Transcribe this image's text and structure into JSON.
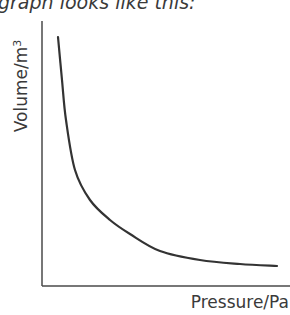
{
  "caption": "graph looks like this:",
  "chart_data": {
    "type": "line",
    "title": "",
    "xlabel": "Pressure/Pa",
    "ylabel": "Volume/m",
    "ylabel_superscript": "3",
    "x_ticks": [],
    "y_ticks": [],
    "grid": false,
    "legend": null,
    "series": [
      {
        "name": "V vs P",
        "color": "#333333",
        "points_px": [
          [
            58,
            37
          ],
          [
            62,
            80
          ],
          [
            66,
            120
          ],
          [
            75,
            170
          ],
          [
            90,
            200
          ],
          [
            110,
            220
          ],
          [
            130,
            234
          ],
          [
            160,
            251
          ],
          [
            200,
            260
          ],
          [
            240,
            264
          ],
          [
            277,
            266
          ]
        ]
      }
    ]
  },
  "colors": {
    "axis": "#4a4a4a",
    "curve": "#333333",
    "text": "#3a3a3a"
  }
}
